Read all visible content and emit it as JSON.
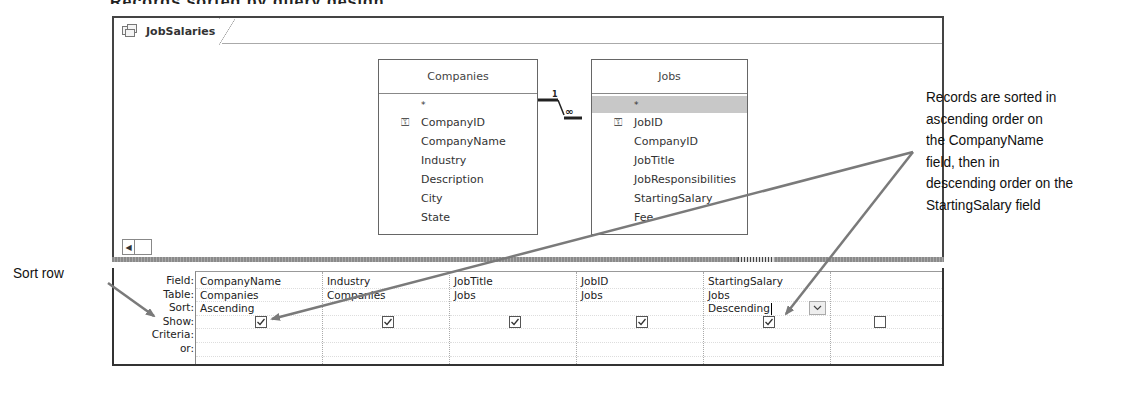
{
  "window": {
    "tab_label": "JobSalaries",
    "tab_icon": "query-icon"
  },
  "tables": [
    {
      "name": "Companies",
      "fields": [
        {
          "label": "*",
          "key": false
        },
        {
          "label": "CompanyID",
          "key": true
        },
        {
          "label": "CompanyName",
          "key": false
        },
        {
          "label": "Industry",
          "key": false
        },
        {
          "label": "Description",
          "key": false
        },
        {
          "label": "City",
          "key": false
        },
        {
          "label": "State",
          "key": false
        }
      ]
    },
    {
      "name": "Jobs",
      "fields": [
        {
          "label": "*",
          "key": false,
          "selected": true
        },
        {
          "label": "JobID",
          "key": true
        },
        {
          "label": "CompanyID",
          "key": false
        },
        {
          "label": "JobTitle",
          "key": false
        },
        {
          "label": "JobResponsibilities",
          "key": false
        },
        {
          "label": "StartingSalary",
          "key": false
        },
        {
          "label": "Fee",
          "key": false
        }
      ]
    }
  ],
  "relationship": {
    "one_side": "1",
    "many_side": "∞"
  },
  "query_grid": {
    "row_labels": [
      "Field:",
      "Table:",
      "Sort:",
      "Show:",
      "Criteria:",
      "or:"
    ],
    "columns": [
      {
        "field": "CompanyName",
        "table": "Companies",
        "sort": "Ascending",
        "show": true,
        "criteria": "",
        "or": ""
      },
      {
        "field": "Industry",
        "table": "Companies",
        "sort": "",
        "show": true,
        "criteria": "",
        "or": ""
      },
      {
        "field": "JobTitle",
        "table": "Jobs",
        "sort": "",
        "show": true,
        "criteria": "",
        "or": ""
      },
      {
        "field": "JobID",
        "table": "Jobs",
        "sort": "",
        "show": true,
        "criteria": "",
        "or": ""
      },
      {
        "field": "StartingSalary",
        "table": "Jobs",
        "sort": "Descending",
        "show": true,
        "criteria": "",
        "or": "",
        "dropdown_open": true
      },
      {
        "field": "",
        "table": "",
        "sort": "",
        "show": false,
        "criteria": "",
        "or": ""
      }
    ]
  },
  "annotations": {
    "records_sorted": [
      "Records are sorted in",
      "ascending order on",
      "the CompanyName",
      "field, then in",
      "descending order on the",
      "StartingSalary field"
    ],
    "sort_row": "Sort row"
  },
  "colors": {
    "arrow": "#7a7a7a",
    "frame": "#444444",
    "selected_row": "#c8c8c8"
  }
}
